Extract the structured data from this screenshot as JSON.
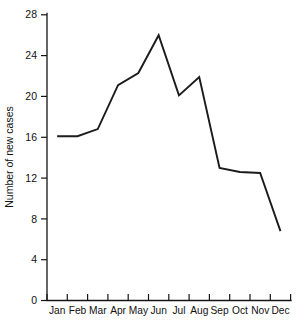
{
  "chart_data": {
    "type": "line",
    "title": "",
    "xlabel": "",
    "ylabel": "Number of new cases",
    "categories": [
      "Jan",
      "Feb",
      "Mar",
      "Apr",
      "May",
      "Jun",
      "Jul",
      "Aug",
      "Sep",
      "Oct",
      "Nov",
      "Dec"
    ],
    "values": [
      16.1,
      16.1,
      16.8,
      21.1,
      22.3,
      26.0,
      20.1,
      21.9,
      13.0,
      12.6,
      12.5,
      6.8
    ],
    "series": [
      {
        "name": "Number of new cases",
        "values": [
          16.1,
          16.1,
          16.8,
          21.1,
          22.3,
          26.0,
          20.1,
          21.9,
          13.0,
          12.6,
          12.5,
          6.8
        ]
      }
    ],
    "ylim": [
      0,
      28
    ],
    "y_ticks": [
      0,
      4,
      8,
      12,
      16,
      20,
      24,
      28
    ],
    "y_tick_labels": [
      "0",
      "4",
      "8",
      "12",
      "16",
      "20",
      "24",
      "28"
    ],
    "x_tick_labels": [
      "Jan",
      "Feb",
      "Mar",
      "Apr",
      "May",
      "Jun",
      "Jul",
      "Aug",
      "Sep",
      "Oct",
      "Nov",
      "Dec"
    ],
    "grid": false,
    "legend": false,
    "legend_position": "none",
    "line_color": "#1b1b1b",
    "axis_color": "#151515",
    "background_color": "#ffffff"
  },
  "axes": {
    "y_title": "Number of new cases",
    "y_labels": {
      "t0": "0",
      "t4": "4",
      "t8": "8",
      "t12": "12",
      "t16": "16",
      "t20": "20",
      "t24": "24",
      "t28": "28"
    },
    "x_labels": {
      "m0": "Jan",
      "m1": "Feb",
      "m2": "Mar",
      "m3": "Apr",
      "m4": "May",
      "m5": "Jun",
      "m6": "Jul",
      "m7": "Aug",
      "m8": "Sep",
      "m9": "Oct",
      "m10": "Nov",
      "m11": "Dec"
    }
  }
}
